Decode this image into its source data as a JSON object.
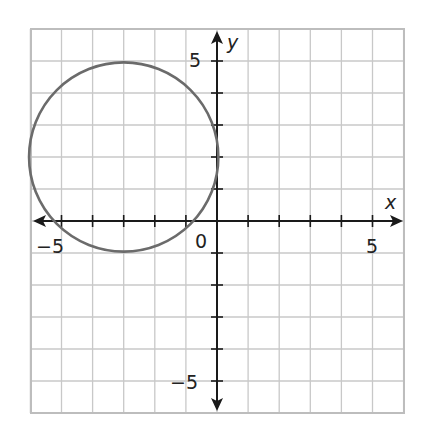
{
  "chart_data": {
    "type": "scatter",
    "title": "",
    "xlabel": "x",
    "ylabel": "y",
    "xlim": [
      -6,
      6
    ],
    "ylim": [
      -6,
      6
    ],
    "grid": true,
    "x_tick_labels": [
      {
        "value": -5,
        "label": "−5"
      },
      {
        "value": 0,
        "label": "0"
      },
      {
        "value": 5,
        "label": "5"
      }
    ],
    "y_tick_labels": [
      {
        "value": 5,
        "label": "5"
      },
      {
        "value": -5,
        "label": "−5"
      }
    ],
    "series": [
      {
        "name": "circle",
        "shape": "circle",
        "center": [
          -3,
          2
        ],
        "radius": 3,
        "color": "#6b6b6b"
      }
    ]
  },
  "labels": {
    "x_axis": "x",
    "y_axis": "y",
    "origin": "0",
    "x_neg5": "−5",
    "x_pos5": "5",
    "y_pos5": "5",
    "y_neg5": "−5"
  },
  "colors": {
    "grid": "#c8c8c8",
    "axis": "#1a1a1a",
    "curve": "#6b6b6b"
  }
}
